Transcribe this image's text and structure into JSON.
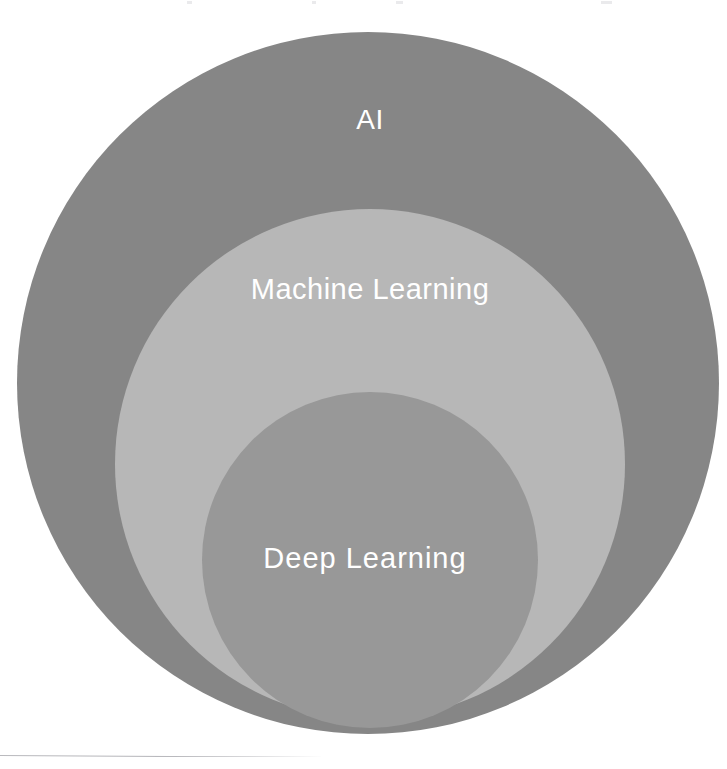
{
  "page": {
    "background_color": "#ffffff",
    "width": 727,
    "height": 769
  },
  "diagram": {
    "type": "nested-venn",
    "title_text": "",
    "circles": [
      {
        "id": "ai",
        "label": "AI",
        "fill": "#868686",
        "label_color": "#ffffff",
        "center_x": 368,
        "center_y": 383,
        "radius": 351,
        "level": 1
      },
      {
        "id": "machine-learning",
        "label": "Machine Learning",
        "fill": "#b7b7b7",
        "label_color": "#ffffff",
        "center_x": 370,
        "center_y": 464,
        "radius": 255,
        "level": 2
      },
      {
        "id": "deep-learning",
        "label": "Deep Learning",
        "fill": "#989898",
        "label_color": "#ffffff",
        "center_x": 370,
        "center_y": 560,
        "radius": 168,
        "level": 3
      }
    ]
  },
  "chart_data": {
    "type": "pie",
    "title": "",
    "categories": [
      "AI",
      "Machine Learning",
      "Deep Learning"
    ],
    "values": [
      351,
      255,
      168
    ],
    "xlabel": "",
    "ylabel": "",
    "legend": [
      "AI",
      "Machine Learning",
      "Deep Learning"
    ],
    "colors": [
      "#868686",
      "#b7b7b7",
      "#989898"
    ],
    "annotations": [
      "AI is the outermost set",
      "Machine Learning is a subset of AI",
      "Deep Learning is a subset of Machine Learning"
    ]
  },
  "footer": {
    "rule_color": "#b9b9bd"
  }
}
